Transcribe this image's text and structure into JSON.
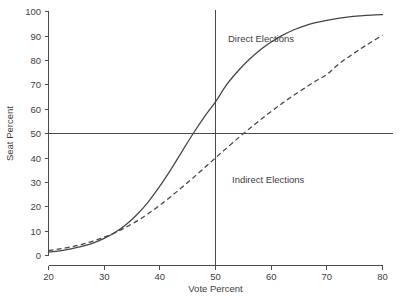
{
  "chart_data": {
    "type": "line",
    "title": "",
    "xlabel": "Vote Percent",
    "ylabel": "Seat Percent",
    "xlim": [
      20,
      80
    ],
    "ylim": [
      0,
      100
    ],
    "xticks": [
      20,
      30,
      40,
      50,
      60,
      70,
      80
    ],
    "yticks": [
      0,
      10,
      20,
      30,
      40,
      50,
      60,
      70,
      80,
      90,
      100
    ],
    "grid": false,
    "legend_position": "inline-annotation",
    "reference_lines": [
      {
        "name": "vertical-50-vote",
        "orientation": "vertical",
        "value": 50
      },
      {
        "name": "horizontal-50-seat",
        "orientation": "horizontal",
        "value": 50
      }
    ],
    "annotations": [
      {
        "text": "Direct Elections",
        "x": 55,
        "y": 93
      },
      {
        "text": "Indirect Elections",
        "x": 56,
        "y": 33
      }
    ],
    "x": [
      20,
      22,
      24,
      26,
      28,
      30,
      32,
      34,
      36,
      38,
      40,
      42,
      44,
      46,
      48,
      50,
      52,
      54,
      56,
      58,
      60,
      62,
      64,
      66,
      68,
      70,
      72,
      74,
      76,
      78,
      80
    ],
    "series": [
      {
        "name": "Direct Elections",
        "style": "solid",
        "color": "#444444",
        "values": [
          1.4,
          1.9,
          2.7,
          3.7,
          5.1,
          7.0,
          9.5,
          12.8,
          17.0,
          22.2,
          28.4,
          35.3,
          42.7,
          50.0,
          56.8,
          63.0,
          70.0,
          75.5,
          80.2,
          84.2,
          87.5,
          90.2,
          92.4,
          94.1,
          95.4,
          96.4,
          97.2,
          97.8,
          98.2,
          98.5,
          98.7
        ]
      },
      {
        "name": "Indirect Elections",
        "style": "dashed",
        "color": "#444444",
        "values": [
          2.0,
          2.7,
          3.5,
          4.6,
          5.9,
          7.5,
          9.4,
          11.7,
          14.3,
          17.3,
          20.6,
          24.2,
          28.0,
          31.9,
          35.9,
          40.0,
          44.0,
          48.0,
          51.8,
          55.5,
          59.0,
          62.4,
          65.6,
          68.6,
          71.5,
          74.2,
          78.2,
          81.5,
          84.6,
          87.5,
          90.3
        ]
      }
    ]
  },
  "labels": {
    "xaxis_title": "Vote Percent",
    "yaxis_title": "Seat Percent",
    "series_direct": "Direct Elections",
    "series_indirect": "Indirect Elections",
    "xtick_20": "20",
    "xtick_30": "30",
    "xtick_40": "40",
    "xtick_50": "50",
    "xtick_60": "60",
    "xtick_70": "70",
    "xtick_80": "80",
    "ytick_0": "0",
    "ytick_10": "10",
    "ytick_20": "20",
    "ytick_30": "30",
    "ytick_40": "40",
    "ytick_50": "50",
    "ytick_60": "60",
    "ytick_70": "70",
    "ytick_80": "80",
    "ytick_90": "90",
    "ytick_100": "100"
  },
  "colors": {
    "axis": "#4a4a4a",
    "curve": "#444444",
    "text": "#3d3d3d",
    "background": "#ffffff"
  }
}
